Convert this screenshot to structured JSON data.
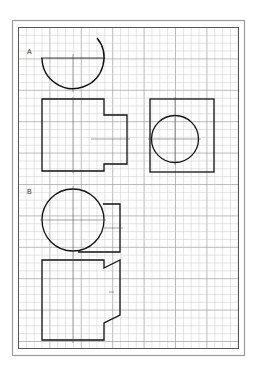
{
  "sheet": {
    "background": "#ffffff",
    "outer_border_color": "#9a9a9a",
    "inner_border_color": "#555555",
    "grid_color": "#c8c8c8",
    "grid_major_color": "#9e9e9e",
    "stroke_color": "#111111",
    "grid_spacing_px": 7.85
  },
  "figures": [
    {
      "label": "A",
      "views": [
        "top-semicircle-arc",
        "front-stepped-block",
        "side-square-with-circle"
      ]
    },
    {
      "label": "B",
      "views": [
        "top-circle-with-rect",
        "front-block-with-notched-side"
      ]
    }
  ]
}
